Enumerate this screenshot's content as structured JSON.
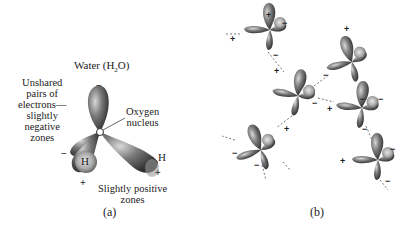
{
  "panel_a": {
    "title": "Water (H",
    "title_sub": "2",
    "title_end": "O)",
    "unshared_label": [
      "Unshared",
      "pairs of",
      "electrons—",
      "slightly",
      "negative",
      "zones"
    ],
    "oxygen_label": [
      "Oxygen",
      "nucleus"
    ],
    "positive_label": [
      "Slightly positive",
      "zones"
    ],
    "atom_o": "O",
    "atom_h1": "H",
    "atom_h2": "H",
    "minus": "−",
    "plus": "+",
    "caption": "(a)"
  },
  "panel_b": {
    "caption": "(b)",
    "molecule_count": 7
  },
  "colors": {
    "lobe_dark": "#3a3a3a",
    "lobe_mid": "#777777",
    "lobe_light": "#bdbdbd",
    "background": "#ffffff"
  }
}
